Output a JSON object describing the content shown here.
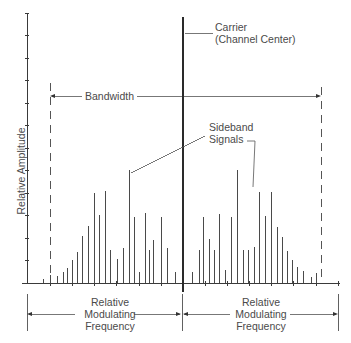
{
  "chart_data": {
    "type": "bar",
    "subtype": "spectrum-lines",
    "title": "",
    "xlabel": "Relative Modulating Frequency",
    "ylabel": "Relative Amplitude",
    "y_ticks_count": 12,
    "grid": false,
    "baseline_y_px": 283,
    "carrier": {
      "label": "Carrier (Channel Center)",
      "x_px": 183,
      "top_px": 17
    },
    "bandwidth": {
      "label": "Bandwidth",
      "left_px": 50,
      "right_px": 321
    },
    "series": [
      {
        "name": "Lower sideband",
        "x_px": [
          43,
          50,
          57,
          63,
          67,
          72,
          77,
          82,
          88,
          94,
          99,
          105,
          110,
          117,
          123,
          129,
          134,
          139,
          145,
          149,
          153,
          161,
          167,
          175
        ],
        "top_px": [
          279,
          275,
          276,
          272,
          268,
          260,
          252,
          236,
          226,
          193,
          215,
          191,
          250,
          259,
          248,
          170,
          217,
          272,
          213,
          250,
          240,
          217,
          248,
          272
        ]
      },
      {
        "name": "Upper sideband",
        "x_px": [
          192,
          199,
          203,
          209,
          214,
          219,
          225,
          231,
          237,
          243,
          248,
          254,
          259,
          265,
          271,
          277,
          282,
          287,
          292,
          297,
          303,
          311,
          316
        ],
        "top_px": [
          272,
          250,
          217,
          239,
          250,
          214,
          270,
          217,
          170,
          250,
          250,
          247,
          192,
          216,
          192,
          227,
          237,
          251,
          260,
          267,
          271,
          277,
          273
        ]
      }
    ]
  },
  "labels": {
    "y_axis": "Relative Amplitude",
    "carrier_line1": "Carrier",
    "carrier_line2": "(Channel Center)",
    "bandwidth": "Bandwidth",
    "sideband_line1": "Sideband",
    "sideband_line2": "Signals",
    "left_freq": [
      "Relative",
      "Modulating",
      "Frequency"
    ],
    "right_freq": [
      "Relative",
      "Modulating",
      "Frequency"
    ]
  },
  "colors": {
    "ink": "#3a3a3a",
    "text": "#4a4a4a",
    "background": "#ffffff"
  }
}
